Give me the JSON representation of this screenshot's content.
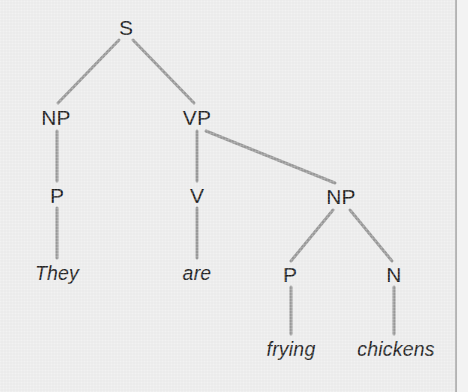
{
  "figure": {
    "type": "syntax-tree",
    "sentence": "They are frying chickens",
    "background_color": "#ededed",
    "branch_color": "#9a9a9a",
    "label_color": "#1f1f1f",
    "margin_rule_color": "#a8a8a8"
  },
  "nodes": [
    {
      "id": "S",
      "label": "S",
      "kind": "category",
      "x": 126,
      "y": 27
    },
    {
      "id": "NP1",
      "label": "NP",
      "kind": "category",
      "x": 56,
      "y": 117
    },
    {
      "id": "VP",
      "label": "VP",
      "kind": "category",
      "x": 197,
      "y": 117
    },
    {
      "id": "P1",
      "label": "P",
      "kind": "category",
      "x": 57,
      "y": 195
    },
    {
      "id": "V",
      "label": "V",
      "kind": "category",
      "x": 197,
      "y": 195
    },
    {
      "id": "NP2",
      "label": "NP",
      "kind": "category",
      "x": 341,
      "y": 196
    },
    {
      "id": "P2",
      "label": "P",
      "kind": "category",
      "x": 290,
      "y": 274
    },
    {
      "id": "N",
      "label": "N",
      "kind": "category",
      "x": 394,
      "y": 274
    }
  ],
  "leaves": [
    {
      "id": "w1",
      "label": "They",
      "parent": "P1",
      "x": 57,
      "y": 274
    },
    {
      "id": "w2",
      "label": "are",
      "parent": "V",
      "x": 197,
      "y": 274
    },
    {
      "id": "w3",
      "label": "frying",
      "parent": "P2",
      "x": 291,
      "y": 350
    },
    {
      "id": "w4",
      "label": "chickens",
      "parent": "N",
      "x": 396,
      "y": 350
    }
  ],
  "edges": [
    {
      "id": "e-s-np1",
      "from": "S",
      "to": "NP1",
      "x1": 119,
      "y1": 40,
      "x2": 58,
      "y2": 103
    },
    {
      "id": "e-s-vp",
      "from": "S",
      "to": "VP",
      "x1": 133,
      "y1": 40,
      "x2": 194,
      "y2": 103
    },
    {
      "id": "e-np1-p1",
      "from": "NP1",
      "to": "P1",
      "x1": 57,
      "y1": 131,
      "x2": 57,
      "y2": 181
    },
    {
      "id": "e-vp-v",
      "from": "VP",
      "to": "V",
      "x1": 197,
      "y1": 131,
      "x2": 197,
      "y2": 181
    },
    {
      "id": "e-vp-np2",
      "from": "VP",
      "to": "NP2",
      "x1": 206,
      "y1": 131,
      "x2": 335,
      "y2": 183
    },
    {
      "id": "e-p1-w1",
      "from": "P1",
      "to": "w1",
      "x1": 57,
      "y1": 208,
      "x2": 57,
      "y2": 258
    },
    {
      "id": "e-v-w2",
      "from": "V",
      "to": "w2",
      "x1": 197,
      "y1": 208,
      "x2": 197,
      "y2": 258
    },
    {
      "id": "e-np2-p2",
      "from": "NP2",
      "to": "P2",
      "x1": 333,
      "y1": 210,
      "x2": 291,
      "y2": 261
    },
    {
      "id": "e-np2-n",
      "from": "NP2",
      "to": "N",
      "x1": 350,
      "y1": 210,
      "x2": 392,
      "y2": 261
    },
    {
      "id": "e-p2-w3",
      "from": "P2",
      "to": "w3",
      "x1": 291,
      "y1": 287,
      "x2": 291,
      "y2": 334
    },
    {
      "id": "e-n-w4",
      "from": "N",
      "to": "w4",
      "x1": 394,
      "y1": 287,
      "x2": 394,
      "y2": 334
    }
  ]
}
